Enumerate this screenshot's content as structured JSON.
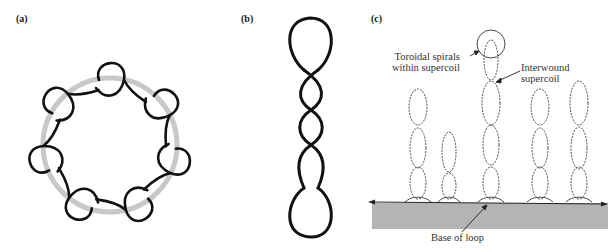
{
  "panels": {
    "a": {
      "label": "(a)"
    },
    "b": {
      "label": "(b)"
    },
    "c": {
      "label": "(c)",
      "annotations": {
        "toroidal_line1": "Toroidal spirals",
        "toroidal_line2": "within supercoil",
        "interwound_line1": "Interwound",
        "interwound_line2": "supercoil",
        "base": "Base of loop"
      }
    }
  },
  "colors": {
    "strand": "#111111",
    "ring": "#c8c8c8",
    "base_fill": "#b4b4b4"
  }
}
